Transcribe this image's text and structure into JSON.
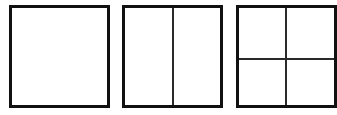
{
  "diagram": {
    "border_color": "#111111",
    "divider_color": "#2a2a2a",
    "background_color": "#ffffff",
    "shapes": [
      {
        "label": "Undivided square",
        "x": 9,
        "y": 5,
        "width": 101,
        "height": 103,
        "vertical_dividers": [],
        "horizontal_dividers": []
      },
      {
        "label": "Square divided into two halves",
        "x": 122,
        "y": 5,
        "width": 101,
        "height": 103,
        "vertical_dividers": [
          49
        ],
        "horizontal_dividers": []
      },
      {
        "label": "Square divided into four quarters",
        "x": 236,
        "y": 5,
        "width": 101,
        "height": 103,
        "vertical_dividers": [
          48
        ],
        "horizontal_dividers": [
          52
        ]
      }
    ]
  }
}
